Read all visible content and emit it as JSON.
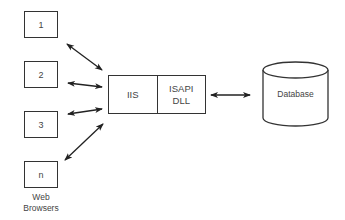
{
  "diagram": {
    "type": "architecture",
    "clients": [
      {
        "id": "client-1",
        "label": "1"
      },
      {
        "id": "client-2",
        "label": "2"
      },
      {
        "id": "client-3",
        "label": "3"
      },
      {
        "id": "client-n",
        "label": "n"
      }
    ],
    "clients_caption": "Web\nBrowsers",
    "server": {
      "cells": [
        {
          "id": "iis",
          "label": "IIS"
        },
        {
          "id": "isapi-dll",
          "label": "ISAPI\nDLL"
        }
      ]
    },
    "database": {
      "label": "Database"
    },
    "edges": [
      {
        "from": "client-1",
        "to": "server",
        "bidirectional": true
      },
      {
        "from": "client-2",
        "to": "server",
        "bidirectional": true
      },
      {
        "from": "client-3",
        "to": "server",
        "bidirectional": true
      },
      {
        "from": "client-n",
        "to": "server",
        "bidirectional": true
      },
      {
        "from": "server",
        "to": "database",
        "bidirectional": true
      }
    ],
    "colors": {
      "stroke": "#333333",
      "text": "#444444",
      "background": "#ffffff"
    }
  }
}
